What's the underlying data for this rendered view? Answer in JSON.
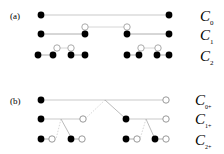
{
  "panel_a": {
    "tag": "(a)",
    "labels": [
      {
        "main": "C",
        "sub": "0"
      },
      {
        "main": "C",
        "sub": "1"
      },
      {
        "main": "C",
        "sub": "2"
      }
    ]
  },
  "panel_b": {
    "tag": "(b)",
    "labels": [
      {
        "main": "C",
        "sub": "0+"
      },
      {
        "main": "C",
        "sub": "1+"
      },
      {
        "main": "C",
        "sub": "2+"
      }
    ]
  },
  "colors": {
    "filled": "#000000",
    "open_stroke": "#aaaaaa",
    "line": "#bbbbbb"
  }
}
